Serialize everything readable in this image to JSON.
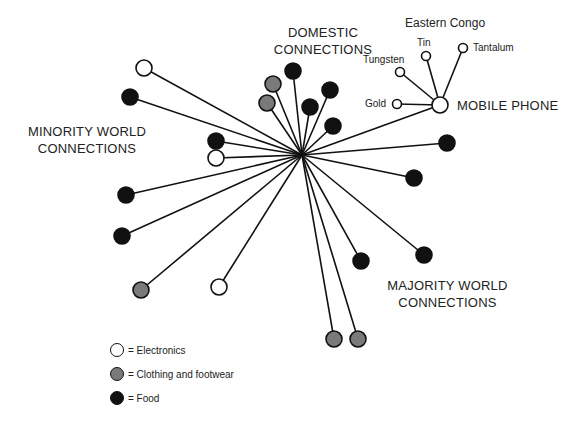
{
  "colors": {
    "electronics": "#ffffff",
    "clothing": "#7a7a7a",
    "food": "#111111",
    "stroke": "#111111"
  },
  "labels": {
    "domestic": [
      "DOMESTIC",
      "CONNECTIONS"
    ],
    "minority": [
      "MINORITY WORLD",
      "CONNECTIONS"
    ],
    "majority": [
      "MAJORITY WORLD",
      "CONNECTIONS"
    ],
    "mobile_phone": "MOBILE PHONE",
    "eastern_congo": "Eastern Congo",
    "minerals": [
      "Tin",
      "Tantalum",
      "Tungsten",
      "Gold"
    ]
  },
  "legend": [
    {
      "type": "electronics",
      "label": "= Electronics"
    },
    {
      "type": "clothing",
      "label": "= Clothing and footwear"
    },
    {
      "type": "food",
      "label": "= Food"
    }
  ],
  "hub": {
    "x": 302,
    "y": 155
  },
  "nodes": [
    {
      "x": 144,
      "y": 68,
      "type": "electronics"
    },
    {
      "x": 130,
      "y": 97,
      "type": "food"
    },
    {
      "x": 216,
      "y": 141,
      "type": "food"
    },
    {
      "x": 216,
      "y": 158,
      "type": "electronics"
    },
    {
      "x": 126,
      "y": 195,
      "type": "food"
    },
    {
      "x": 122,
      "y": 236,
      "type": "food"
    },
    {
      "x": 141,
      "y": 290,
      "type": "clothing"
    },
    {
      "x": 219,
      "y": 287,
      "type": "electronics"
    },
    {
      "x": 273,
      "y": 84,
      "type": "clothing"
    },
    {
      "x": 267,
      "y": 103,
      "type": "clothing"
    },
    {
      "x": 293,
      "y": 71,
      "type": "food"
    },
    {
      "x": 310,
      "y": 107,
      "type": "food"
    },
    {
      "x": 330,
      "y": 90,
      "type": "food"
    },
    {
      "x": 333,
      "y": 126,
      "type": "food"
    },
    {
      "x": 447,
      "y": 143,
      "type": "food"
    },
    {
      "x": 414,
      "y": 178,
      "type": "food"
    },
    {
      "x": 424,
      "y": 255,
      "type": "food"
    },
    {
      "x": 361,
      "y": 261,
      "type": "food"
    },
    {
      "x": 334,
      "y": 339,
      "type": "clothing"
    },
    {
      "x": 358,
      "y": 339,
      "type": "clothing"
    },
    {
      "x": 440,
      "y": 105,
      "type": "electronics",
      "r": 8
    }
  ],
  "phone": {
    "x": 440,
    "y": 105,
    "minerals": [
      {
        "x": 397,
        "y": 104,
        "name": "Gold"
      },
      {
        "x": 400,
        "y": 72,
        "name": "Tungsten"
      },
      {
        "x": 426,
        "y": 56,
        "name": "Tin"
      },
      {
        "x": 463,
        "y": 48,
        "name": "Tantalum"
      }
    ]
  }
}
